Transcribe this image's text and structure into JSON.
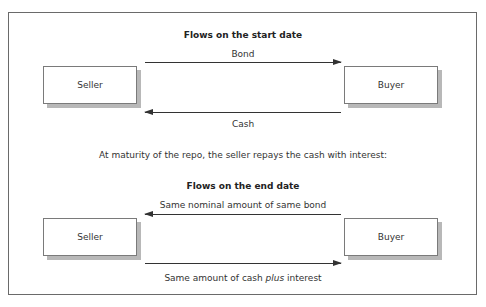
{
  "start_section": {
    "title": "Flows on the start date",
    "left_party": "Seller",
    "right_party": "Buyer",
    "top_flow": {
      "label": "Bond",
      "direction": "seller-to-buyer"
    },
    "bottom_flow": {
      "label": "Cash",
      "direction": "buyer-to-seller"
    }
  },
  "middle_text": "At maturity of the repo, the seller repays the cash with interest:",
  "end_section": {
    "title": "Flows on the end date",
    "left_party": "Seller",
    "right_party": "Buyer",
    "top_flow": {
      "label": "Same nominal amount of same bond",
      "direction": "buyer-to-seller"
    },
    "bottom_flow": {
      "label_prefix": "Same amount of cash ",
      "label_emphasis": "plus",
      "label_suffix": " interest",
      "direction": "seller-to-buyer"
    }
  }
}
